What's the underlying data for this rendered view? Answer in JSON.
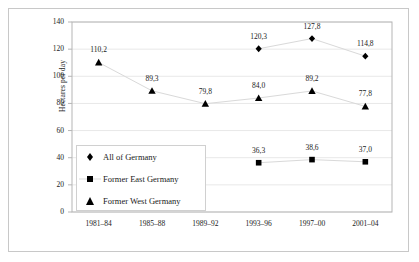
{
  "chart_data": {
    "type": "line",
    "title": "",
    "subtitle": "",
    "xlabel": "",
    "ylabel": "Hectares per day",
    "categories": [
      "1981–84",
      "1985–88",
      "1989–92",
      "1993–96",
      "1997–00",
      "2001–04"
    ],
    "ylim": [
      0,
      140
    ],
    "y_ticks": [
      "0",
      "20",
      "40",
      "60",
      "80",
      "100",
      "120",
      "140"
    ],
    "y_tick_step": 20,
    "grid": "horizontal",
    "legend_position": "inside-lower-left",
    "decimal_separator": ",",
    "series": [
      {
        "name": "All of Germany",
        "marker": "diamond",
        "values": [
          null,
          null,
          null,
          120.3,
          127.8,
          114.8
        ],
        "labels": [
          "",
          "",
          "",
          "120,3",
          "127,8",
          "114,8"
        ]
      },
      {
        "name": "Former East Germany",
        "marker": "square",
        "values": [
          null,
          null,
          null,
          36.3,
          38.6,
          37.0
        ],
        "labels": [
          "",
          "",
          "",
          "36,3",
          "38,6",
          "37,0"
        ]
      },
      {
        "name": "Former West Germany",
        "marker": "triangle",
        "values": [
          110.2,
          89.3,
          79.8,
          84.0,
          89.2,
          77.8
        ],
        "labels": [
          "110,2",
          "89,3",
          "79,8",
          "84,0",
          "89,2",
          "77,8"
        ]
      }
    ]
  },
  "colors": {
    "marker": "#000000",
    "line": "#d9d9d9",
    "grid": "#e8e8e8",
    "axis": "#b5b5b5",
    "frame": "#c8c8c8",
    "text": "#1a1a1a"
  }
}
